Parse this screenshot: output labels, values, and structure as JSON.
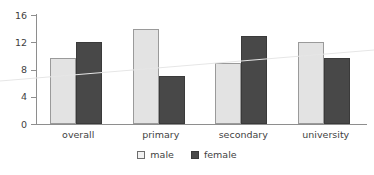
{
  "chart_data": {
    "type": "bar",
    "title": "",
    "subtitle": "",
    "xlabel": "",
    "ylabel": "",
    "categories": [
      "overall",
      "primary",
      "secondary",
      "university"
    ],
    "series": [
      {
        "name": "male",
        "values": [
          9.7,
          14.0,
          9.0,
          12.1
        ],
        "color": "#e3e3e3"
      },
      {
        "name": "female",
        "values": [
          12.0,
          7.0,
          12.9,
          9.7
        ],
        "color": "#484848"
      }
    ],
    "ylim": [
      0,
      16
    ],
    "yticks": [
      0,
      4,
      8,
      12,
      16
    ],
    "ytick_labels": [
      "0",
      "4",
      "8",
      "12",
      "16"
    ],
    "grid": false,
    "legend_position": "bottom-center",
    "annotations": [
      {
        "name": "faint-diagonal-scan-line",
        "from_y": 81,
        "to_y": 50
      }
    ]
  },
  "legend": {
    "items": [
      {
        "label": "male",
        "swatch": "light-gray-square"
      },
      {
        "label": "female",
        "swatch": "dark-gray-square"
      }
    ]
  },
  "colors": {
    "male_bar": "#e3e3e3",
    "female_bar": "#484848",
    "axis": "#8e8e8e",
    "text": "#3f3f3f",
    "background": "#ffffff",
    "scan_line": "#e6e6e6"
  }
}
